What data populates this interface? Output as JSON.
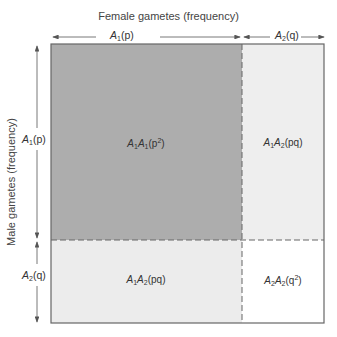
{
  "diagram": {
    "title_top": "Female gametes (frequency)",
    "title_left": "Male gametes (frequency)",
    "female_axis": [
      {
        "allele": "A",
        "sub": "1",
        "freq": "(p)"
      },
      {
        "allele": "A",
        "sub": "2",
        "freq": "(q)"
      }
    ],
    "male_axis": [
      {
        "allele": "A",
        "sub": "1",
        "freq": "(p)"
      },
      {
        "allele": "A",
        "sub": "2",
        "freq": "(q)"
      }
    ],
    "cells": [
      {
        "g1": "A",
        "s1": "1",
        "g2": "A",
        "s2": "1",
        "freq_pre": "(p",
        "sup": "2",
        "freq_post": ")",
        "color": "#adadad"
      },
      {
        "g1": "A",
        "s1": "1",
        "g2": "A",
        "s2": "2",
        "freq_pre": "(pq)",
        "sup": "",
        "freq_post": "",
        "color": "#eeeeee"
      },
      {
        "g1": "A",
        "s1": "1",
        "g2": "A",
        "s2": "2",
        "freq_pre": "(pq)",
        "sup": "",
        "freq_post": "",
        "color": "#eeeeee"
      },
      {
        "g1": "A",
        "s1": "2",
        "g2": "A",
        "s2": "2",
        "freq_pre": "(q",
        "sup": "2",
        "freq_post": ")",
        "color": "#ffffff"
      }
    ],
    "colors": {
      "border": "#666666",
      "arrow": "#555555",
      "dashed": "#666666"
    }
  }
}
